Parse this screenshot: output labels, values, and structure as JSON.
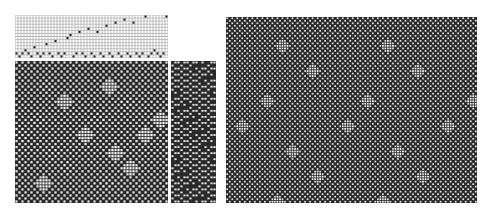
{
  "figure": {
    "type": "weaving-draft",
    "panels": [
      {
        "id": "threading",
        "label": "Threading draft",
        "columns": 51,
        "rows": 14
      },
      {
        "id": "drawdown",
        "label": "Drawdown (detail)",
        "columns": 51,
        "rows": 47
      },
      {
        "id": "treadling",
        "label": "Treadling",
        "columns": 15,
        "rows": 47
      },
      {
        "id": "fabric",
        "label": "Fabric simulation",
        "columns": 100,
        "rows": 74
      }
    ],
    "threading_points": [
      [
        0,
        1
      ],
      [
        1,
        0
      ],
      [
        2,
        1
      ],
      [
        3,
        2
      ],
      [
        4,
        1
      ],
      [
        5,
        0
      ],
      [
        6,
        3
      ],
      [
        7,
        1
      ],
      [
        8,
        0
      ],
      [
        9,
        1
      ],
      [
        10,
        4
      ],
      [
        11,
        1
      ],
      [
        12,
        0
      ],
      [
        13,
        5
      ],
      [
        14,
        1
      ],
      [
        15,
        0
      ],
      [
        16,
        1
      ],
      [
        17,
        6
      ],
      [
        18,
        7
      ],
      [
        19,
        0
      ],
      [
        20,
        1
      ],
      [
        21,
        8
      ],
      [
        22,
        1
      ],
      [
        23,
        0
      ],
      [
        24,
        9
      ],
      [
        25,
        1
      ],
      [
        26,
        0
      ],
      [
        27,
        8
      ],
      [
        28,
        1
      ],
      [
        29,
        0
      ],
      [
        30,
        10
      ],
      [
        31,
        1
      ],
      [
        32,
        0
      ],
      [
        33,
        11
      ],
      [
        34,
        1
      ],
      [
        35,
        0
      ],
      [
        36,
        12
      ],
      [
        37,
        1
      ],
      [
        38,
        0
      ],
      [
        39,
        11
      ],
      [
        40,
        1
      ],
      [
        41,
        0
      ],
      [
        42,
        1
      ],
      [
        43,
        13
      ],
      [
        44,
        0
      ],
      [
        45,
        1
      ],
      [
        46,
        2
      ],
      [
        47,
        1
      ],
      [
        48,
        0
      ],
      [
        49,
        1
      ],
      [
        50,
        13
      ]
    ],
    "motif": {
      "shape": "diamond-dot",
      "positions": [
        [
          10,
          5
        ],
        [
          31,
          5
        ],
        [
          16,
          11
        ],
        [
          37,
          11
        ],
        [
          7,
          18
        ],
        [
          27,
          18
        ],
        [
          48,
          18
        ],
        [
          2,
          24
        ],
        [
          23,
          24
        ],
        [
          43,
          24
        ],
        [
          12,
          30
        ],
        [
          33,
          30
        ],
        [
          17,
          36
        ],
        [
          38,
          36
        ],
        [
          9,
          42
        ],
        [
          30,
          42
        ]
      ]
    },
    "colors": {
      "ink": "#1a1a1a",
      "paper": "#ffffff",
      "grid": "#9a9a9a",
      "fabric_dark": "#2a2a2a",
      "fabric_light": "#e6e6e6"
    }
  }
}
